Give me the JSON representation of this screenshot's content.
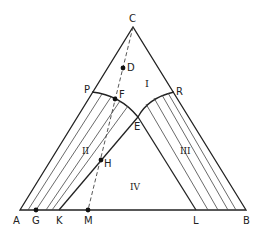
{
  "diagram": {
    "type": "ternary-phase-diagram",
    "colors": {
      "line": "#222222",
      "tie": "#444444",
      "background": "#ffffff"
    },
    "vertices": {
      "A": {
        "label": "A",
        "x": 20,
        "y": 210
      },
      "B": {
        "label": "B",
        "x": 246,
        "y": 210
      },
      "C": {
        "label": "C",
        "x": 133,
        "y": 27
      }
    },
    "points": {
      "P": {
        "label": "P",
        "x": 92,
        "y": 92
      },
      "R": {
        "label": "R",
        "x": 174,
        "y": 92
      },
      "E": {
        "label": "E",
        "x": 138,
        "y": 117
      },
      "F": {
        "label": "F",
        "x": 115,
        "y": 99
      },
      "D": {
        "label": "D",
        "x": 123,
        "y": 68
      },
      "H": {
        "label": "H",
        "x": 101,
        "y": 160
      },
      "G": {
        "label": "G",
        "x": 36,
        "y": 210
      },
      "K": {
        "label": "K",
        "x": 59,
        "y": 210
      },
      "M": {
        "label": "M",
        "x": 88,
        "y": 210
      },
      "L": {
        "label": "L",
        "x": 196,
        "y": 210
      }
    },
    "regions": {
      "I": {
        "label": "I",
        "x": 148,
        "y": 86
      },
      "II": {
        "label": "II",
        "x": 86,
        "y": 150
      },
      "III": {
        "label": "III",
        "x": 185,
        "y": 150
      },
      "IV": {
        "label": "IV",
        "x": 136,
        "y": 187
      }
    },
    "point_labels": {
      "C": "C",
      "D": "D",
      "P": "P",
      "F": "F",
      "R": "R",
      "E": "E",
      "H": "H",
      "A": "A",
      "G": "G",
      "K": "K",
      "M": "M",
      "L": "L",
      "B": "B"
    },
    "region_labels": {
      "I": "I",
      "II": "II",
      "III": "III",
      "IV": "IV"
    }
  }
}
